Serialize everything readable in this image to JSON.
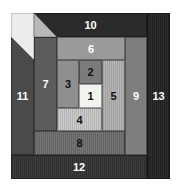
{
  "diagram": {
    "type": "log-cabin-quilt-block",
    "patches": [
      {
        "label": "1",
        "color": "#f2f2ef"
      },
      {
        "label": "2",
        "color": "#7b7b7b"
      },
      {
        "label": "3",
        "color": "#8f8f8f"
      },
      {
        "label": "4",
        "color": "#c9c9c9"
      },
      {
        "label": "5",
        "color": "#b3b3b3"
      },
      {
        "label": "6",
        "color": "#9a9a9a"
      },
      {
        "label": "7",
        "color": "#5c5c5c"
      },
      {
        "label": "8",
        "color": "#6f6f6f"
      },
      {
        "label": "9",
        "color": "#7e7e7e"
      },
      {
        "label": "10",
        "color": "#2b2b2b"
      },
      {
        "label": "11",
        "color": "#4a4a4a"
      },
      {
        "label": "12",
        "color": "#343434"
      },
      {
        "label": "13",
        "color": "#252525"
      }
    ],
    "corner_light": "#ececea",
    "corner_triangle": "#b8b8b8"
  }
}
